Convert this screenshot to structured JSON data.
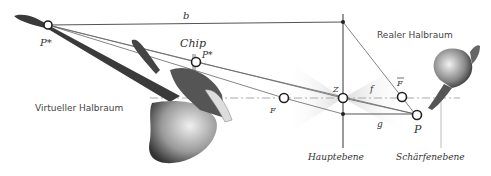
{
  "labels": {
    "b": "b",
    "p_star_left": "P*",
    "chip": "Chip",
    "p_star_chip": "P*",
    "virtual_half_space": "Virtueller Halbraum",
    "real_half_space": "Realer Halbraum",
    "focal_left": "F",
    "center": "Z",
    "f": "f",
    "focal_right": "F",
    "g": "g",
    "p": "P",
    "principal_plane": "Hauptebene",
    "focus_plane": "Schärfenebene"
  },
  "colors": {
    "line": "#555555",
    "axis": "#aaaaaa",
    "cone": "#dcdcdc",
    "object_dark": "#333333",
    "object_mid": "#888888"
  }
}
